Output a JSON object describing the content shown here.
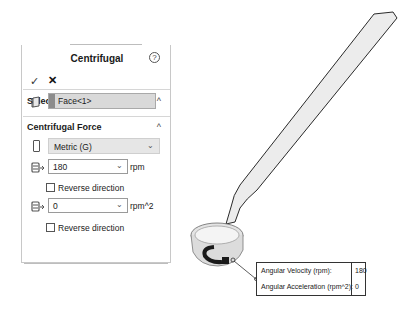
{
  "panel": {
    "title": "Centrifugal",
    "help_icon": "?",
    "ok_icon": "✓",
    "cancel_icon": "✕",
    "selected_reference": {
      "title": "Selected Reference",
      "collapse_icon": "^",
      "face_value": "Face<1>"
    },
    "centrifugal_force": {
      "title": "Centrifugal Force",
      "collapse_icon": "^",
      "units_select": "Metric (G)",
      "angular_velocity": {
        "value": "180",
        "unit": "rpm"
      },
      "reverse_direction_1": {
        "label": "Reverse direction",
        "checked": false
      },
      "angular_acceleration": {
        "value": "0",
        "unit": "rpm^2"
      },
      "reverse_direction_2": {
        "label": "Reverse direction",
        "checked": false
      }
    }
  },
  "callout": {
    "rows": [
      {
        "label": "Angular Velocity (rpm):",
        "value": "180"
      },
      {
        "label": "Angular Acceleration (rpm^2):",
        "value": "0"
      }
    ]
  },
  "colors": {
    "field_bg": "#d9d9d9",
    "select_bg": "#e6e6e6",
    "model_fill": "#ececec",
    "model_stroke": "#2a2a2a"
  }
}
